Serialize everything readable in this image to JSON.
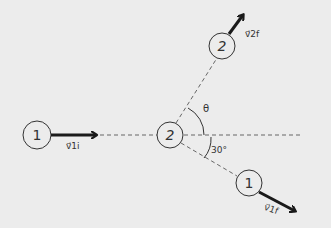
{
  "diagram": {
    "background": "#ececec",
    "stroke_color": "#1a1a1a",
    "dash_color": "#666666",
    "particles": [
      {
        "id": "p1-initial",
        "label": "1",
        "cx": 37,
        "cy": 135,
        "r": 14
      },
      {
        "id": "p2-target",
        "label": "2",
        "cx": 170,
        "cy": 135,
        "r": 13
      },
      {
        "id": "p2-final",
        "label": "2",
        "cx": 222,
        "cy": 46,
        "r": 13
      },
      {
        "id": "p1-final",
        "label": "1",
        "cx": 249,
        "cy": 183,
        "r": 13
      }
    ],
    "vectors": [
      {
        "id": "v1i",
        "label": "v⃗1i",
        "text": "v1i"
      },
      {
        "id": "v2f",
        "label": "v⃗2f",
        "text": "v2f"
      },
      {
        "id": "v1f",
        "label": "v⃗1f",
        "text": "v1f"
      }
    ],
    "angles": {
      "theta": "θ",
      "lower": "30°"
    }
  }
}
